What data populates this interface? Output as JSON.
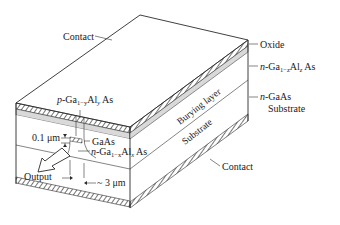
{
  "figure": {
    "type": "device cross-section diagram"
  },
  "labels": {
    "contact_top": "Contact",
    "oxide": "Oxide",
    "n_gaalas_z_prefix": "n",
    "n_gaalas_z_main": "-Ga",
    "n_gaalas_z_sub": "1−z",
    "n_gaalas_z_al": "Al",
    "n_gaalas_z_alsub": "z",
    "n_gaalas_z_tail": " As",
    "n_gaas_prefix": "n",
    "n_gaas_main": "-GaAs",
    "substrate_right": "Substrate",
    "p_gaalas_prefix": "p",
    "p_gaalas_main": "-Ga",
    "p_gaalas_sub": "1−y",
    "p_gaalas_al": "Al",
    "p_gaalas_alsub": "y",
    "p_gaalas_tail": " As",
    "thickness": "0.1 μm",
    "gaas": "GaAs",
    "n_gaalas_x_prefix": "n",
    "n_gaalas_x_main": "-Ga",
    "n_gaalas_x_sub": "1−x",
    "n_gaalas_x_al": "Al",
    "n_gaalas_x_alsub": "x",
    "n_gaalas_x_tail": " As",
    "output": "Output",
    "width": "~ 3 μm",
    "burying_layer": "Burying layer",
    "substrate_side": "Substrate",
    "contact_bottom": "Contact"
  },
  "colors": {
    "line": "#2a2a2a",
    "oxide_fill": "#d9d9d9",
    "background": "#ffffff"
  }
}
